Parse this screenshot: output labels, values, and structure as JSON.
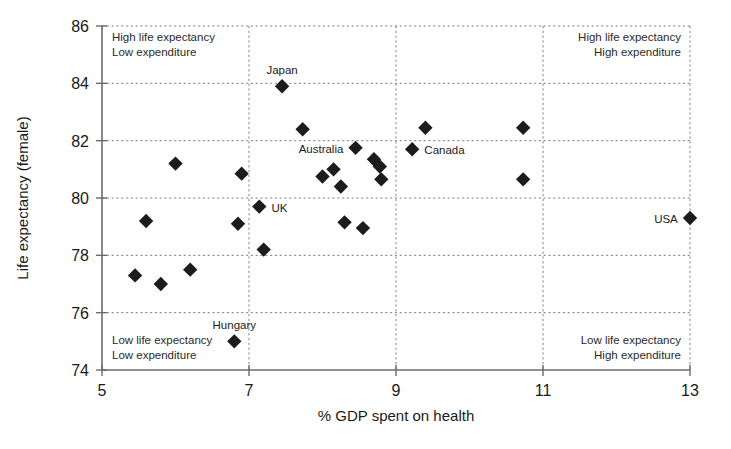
{
  "chart_data": {
    "type": "scatter",
    "title": "",
    "xlabel": "% GDP spent on health",
    "ylabel": "Life expectancy (female)",
    "xlim": [
      5,
      13
    ],
    "ylim": [
      74,
      86
    ],
    "xticks": [
      "5",
      "7",
      "9",
      "11",
      "13"
    ],
    "yticks": [
      "74",
      "76",
      "78",
      "80",
      "82",
      "84",
      "86"
    ],
    "grid": true,
    "gridlines_x": [
      7,
      9,
      11,
      13
    ],
    "gridlines_y": [
      76,
      78,
      80,
      82,
      84,
      86
    ],
    "legend": "none",
    "marker_shape": "filled-diamond",
    "marker_color": "#1c1c1c",
    "points": [
      {
        "x": 5.45,
        "y": 77.3,
        "label": ""
      },
      {
        "x": 5.6,
        "y": 79.2,
        "label": ""
      },
      {
        "x": 5.8,
        "y": 77.0,
        "label": ""
      },
      {
        "x": 6.0,
        "y": 81.2,
        "label": ""
      },
      {
        "x": 6.2,
        "y": 77.5,
        "label": ""
      },
      {
        "x": 6.8,
        "y": 75.0,
        "label": "Hungary",
        "label_pos": "above"
      },
      {
        "x": 6.85,
        "y": 79.1,
        "label": ""
      },
      {
        "x": 6.9,
        "y": 80.85,
        "label": ""
      },
      {
        "x": 7.14,
        "y": 79.7,
        "label": "UK",
        "label_pos": "right"
      },
      {
        "x": 7.2,
        "y": 78.2,
        "label": ""
      },
      {
        "x": 7.45,
        "y": 83.9,
        "label": "Japan",
        "label_pos": "above"
      },
      {
        "x": 7.73,
        "y": 82.4,
        "label": ""
      },
      {
        "x": 8.0,
        "y": 80.75,
        "label": ""
      },
      {
        "x": 8.15,
        "y": 81.0,
        "label": ""
      },
      {
        "x": 8.25,
        "y": 80.4,
        "label": ""
      },
      {
        "x": 8.3,
        "y": 79.15,
        "label": ""
      },
      {
        "x": 8.45,
        "y": 81.75,
        "label": "Australia",
        "label_pos": "left"
      },
      {
        "x": 8.55,
        "y": 78.95,
        "label": ""
      },
      {
        "x": 8.7,
        "y": 81.35,
        "label": ""
      },
      {
        "x": 8.78,
        "y": 81.1,
        "label": ""
      },
      {
        "x": 8.8,
        "y": 80.65,
        "label": ""
      },
      {
        "x": 9.22,
        "y": 81.7,
        "label": "Canada",
        "label_pos": "right"
      },
      {
        "x": 9.4,
        "y": 82.45,
        "label": ""
      },
      {
        "x": 10.73,
        "y": 82.45,
        "label": ""
      },
      {
        "x": 10.73,
        "y": 80.65,
        "label": ""
      },
      {
        "x": 13.0,
        "y": 79.3,
        "label": "USA",
        "label_pos": "left"
      }
    ],
    "annotations": [
      {
        "name": "top-left",
        "line1": "High life expectancy",
        "line2": "Low expenditure"
      },
      {
        "name": "top-right",
        "line1": "High life expectancy",
        "line2": "High expenditure"
      },
      {
        "name": "bottom-left",
        "line1": "Low life expectancy",
        "line2": "Low expenditure"
      },
      {
        "name": "bottom-right",
        "line1": "Low life expectancy",
        "line2": "High expenditure"
      }
    ]
  },
  "axis": {
    "x_title": "% GDP spent on health",
    "y_title": "Life expectancy (female)"
  },
  "ticks": {
    "x": [
      "5",
      "7",
      "9",
      "11",
      "13"
    ],
    "y": [
      "74",
      "76",
      "78",
      "80",
      "82",
      "84",
      "86"
    ]
  },
  "annotations": {
    "top_left_1": "High life expectancy",
    "top_left_2": "Low expenditure",
    "top_right_1": "High life expectancy",
    "top_right_2": "High expenditure",
    "bottom_left_1": "Low life expectancy",
    "bottom_left_2": "Low expenditure",
    "bottom_right_1": "Low life expectancy",
    "bottom_right_2": "High expenditure"
  },
  "point_labels": {
    "japan": "Japan",
    "australia": "Australia",
    "canada": "Canada",
    "uk": "UK",
    "usa": "USA",
    "hungary": "Hungary"
  }
}
